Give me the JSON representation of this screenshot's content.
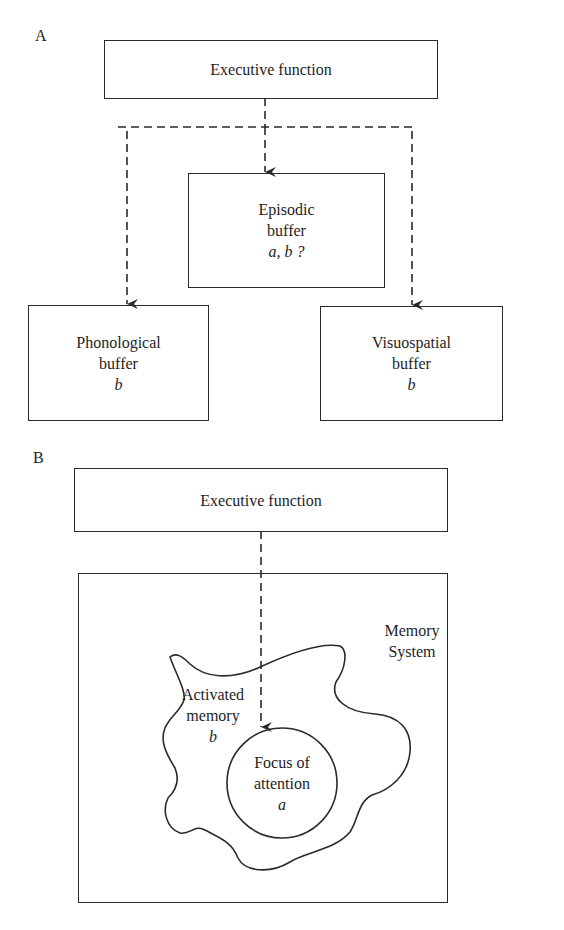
{
  "panel_a": {
    "label": "A",
    "executive": "Executive function",
    "episodic": {
      "line1": "Episodic",
      "line2": "buffer",
      "line3": "a, b ?"
    },
    "phonological": {
      "line1": "Phonological",
      "line2": "buffer",
      "line3": "b"
    },
    "visuospatial": {
      "line1": "Visuospatial",
      "line2": "buffer",
      "line3": "b"
    }
  },
  "panel_b": {
    "label": "B",
    "executive": "Executive function",
    "memory_system": {
      "line1": "Memory",
      "line2": "System"
    },
    "activated_memory": {
      "line1": "Activated",
      "line2": "memory",
      "line3": "b"
    },
    "focus": {
      "line1": "Focus of",
      "line2": "attention",
      "line3": "a"
    }
  },
  "colors": {
    "stroke": "#2a2a2a",
    "text": "#1e1e1e",
    "background": "#ffffff"
  }
}
